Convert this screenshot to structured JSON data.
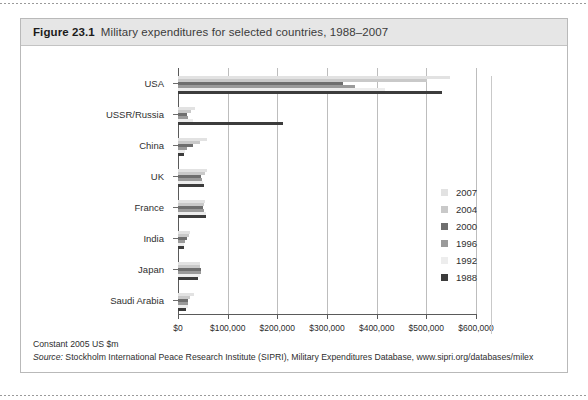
{
  "figure": {
    "number": "Figure 23.1",
    "title": "Military expenditures for selected countries, 1988–2007"
  },
  "footer": {
    "units": "Constant 2005 US $m",
    "source_label": "Source:",
    "source_text": " Stockholm International Peace Research Institute (SIPRI), Military Expenditures Database, www.sipri.org/databases/milex"
  },
  "colors": {
    "y2007": "#e2e2e2",
    "y2004": "#c9c9c9",
    "y2000": "#6e6e6e",
    "y1996": "#9a9a9a",
    "y1992": "#ededed",
    "y1988": "#3c3c3c",
    "grid": "#bdbdbd",
    "axis": "#5a5a5a",
    "header_bg": "#e6e6e6"
  },
  "chart_data": {
    "type": "bar",
    "orientation": "horizontal",
    "title": "Military expenditures for selected countries, 1988–2007",
    "xlabel": "",
    "ylabel": "",
    "xlim": [
      0,
      600000
    ],
    "xticks": [
      0,
      100000,
      200000,
      300000,
      400000,
      500000,
      600000
    ],
    "xticklabels": [
      "$0",
      "$100,000",
      "$200,000",
      "$300,000",
      "$400,000",
      "$500,000",
      "$600,000"
    ],
    "grid": true,
    "legend_position": "right",
    "units": "Constant 2005 US $m",
    "categories": [
      "USA",
      "USSR/Russia",
      "China",
      "UK",
      "France",
      "India",
      "Japan",
      "Saudi Arabia"
    ],
    "series": [
      {
        "name": "2007",
        "color": "#e2e2e2",
        "values": [
          547000,
          35000,
          58000,
          59000,
          54000,
          24000,
          44000,
          33000
        ]
      },
      {
        "name": "2004",
        "color": "#c9c9c9",
        "values": [
          501000,
          26000,
          44000,
          55000,
          53000,
          22000,
          45000,
          25000
        ]
      },
      {
        "name": "2000",
        "color": "#6e6e6e",
        "values": [
          332000,
          19000,
          31000,
          47000,
          51000,
          18000,
          46000,
          21000
        ]
      },
      {
        "name": "1996",
        "color": "#9a9a9a",
        "values": [
          356000,
          21000,
          19000,
          48000,
          53000,
          14000,
          46000,
          20000
        ]
      },
      {
        "name": "1992",
        "color": "#ededed",
        "values": [
          417000,
          30000,
          14000,
          50000,
          57000,
          13000,
          44000,
          21000
        ]
      },
      {
        "name": "1988",
        "color": "#3c3c3c",
        "values": [
          531000,
          211000,
          12000,
          52000,
          56000,
          12000,
          40000,
          17000
        ]
      }
    ]
  }
}
